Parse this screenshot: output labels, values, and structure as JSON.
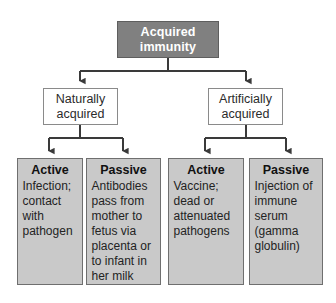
{
  "diagram": {
    "colors": {
      "root_fill": "#808080",
      "root_text": "#ffffff",
      "branch_fill": "#ffffff",
      "branch_border": "#8a8a8a",
      "leaf_fill": "#c9c9c9",
      "leaf_border": "#6f6f6f",
      "connector": "#3a3a3a",
      "background": "#ffffff"
    },
    "root": {
      "label": "Acquired\nimmunity"
    },
    "branches": [
      {
        "label": "Naturally\nacquired"
      },
      {
        "label": "Artificially\nacquired"
      }
    ],
    "leaves": [
      {
        "title": "Active",
        "body": "Infection; contact with pathogen"
      },
      {
        "title": "Passive",
        "body": "Antibodies pass from mother to fetus via placenta or to infant in her milk"
      },
      {
        "title": "Active",
        "body": "Vaccine; dead or attenuated pathogens"
      },
      {
        "title": "Passive",
        "body": "Injection of immune serum (gamma globulin)"
      }
    ]
  }
}
